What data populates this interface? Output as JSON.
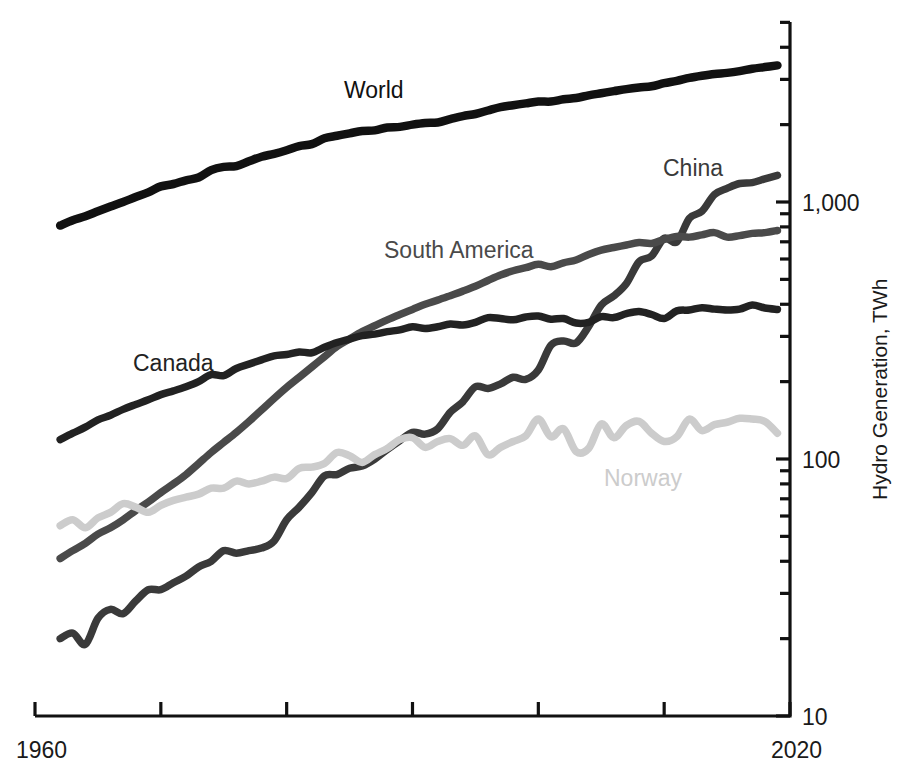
{
  "chart_data": {
    "type": "line",
    "title": "",
    "xlabel": "",
    "ylabel": "Hydro Generation, TWh",
    "yscale": "log",
    "ylim": [
      10,
      3000
    ],
    "xlim": [
      1960,
      2020
    ],
    "grid": false,
    "legend_position": "inline-labels",
    "y_tick_labels": [
      "1,000",
      "100",
      "10"
    ],
    "y_tick_values": [
      1000,
      100,
      10
    ],
    "x_tick_labels": [
      "1960",
      "2020"
    ],
    "x_tick_values": [
      1960,
      1970,
      1980,
      1990,
      2000,
      2010,
      2020
    ],
    "x_visible_tick_labels": [
      {
        "label": "1960",
        "value": 1960
      },
      {
        "label": "2020",
        "value": 2020
      }
    ],
    "series": [
      {
        "name": "World",
        "label": "World",
        "color": "#111111",
        "label_x": 344,
        "label_y": 98,
        "x": [
          1962,
          1963,
          1964,
          1965,
          1966,
          1967,
          1968,
          1969,
          1970,
          1971,
          1972,
          1973,
          1974,
          1975,
          1976,
          1977,
          1978,
          1979,
          1980,
          1981,
          1982,
          1983,
          1984,
          1985,
          1986,
          1987,
          1988,
          1989,
          1990,
          1991,
          1992,
          1993,
          1994,
          1995,
          1996,
          1997,
          1998,
          1999,
          2000,
          2001,
          2002,
          2003,
          2004,
          2005,
          2006,
          2007,
          2008,
          2009,
          2010,
          2011,
          2012,
          2013,
          2014,
          2015,
          2016,
          2017,
          2018,
          2019
        ],
        "values": [
          810,
          850,
          880,
          920,
          960,
          1000,
          1045,
          1090,
          1150,
          1175,
          1215,
          1245,
          1330,
          1370,
          1380,
          1440,
          1500,
          1540,
          1590,
          1650,
          1680,
          1770,
          1810,
          1850,
          1890,
          1900,
          1950,
          1960,
          2000,
          2030,
          2040,
          2100,
          2160,
          2200,
          2270,
          2340,
          2380,
          2420,
          2460,
          2460,
          2510,
          2540,
          2600,
          2650,
          2700,
          2750,
          2790,
          2820,
          2900,
          2960,
          3040,
          3100,
          3150,
          3180,
          3230,
          3300,
          3350,
          3400
        ]
      },
      {
        "name": "China",
        "label": "China",
        "color": "#3a3a3a",
        "label_x": 663,
        "label_y": 176,
        "x": [
          1962,
          1963,
          1964,
          1965,
          1966,
          1967,
          1968,
          1969,
          1970,
          1971,
          1972,
          1973,
          1974,
          1975,
          1976,
          1977,
          1978,
          1979,
          1980,
          1981,
          1982,
          1983,
          1984,
          1985,
          1986,
          1987,
          1988,
          1989,
          1990,
          1991,
          1992,
          1993,
          1994,
          1995,
          1996,
          1997,
          1998,
          1999,
          2000,
          2001,
          2002,
          2003,
          2004,
          2005,
          2006,
          2007,
          2008,
          2009,
          2010,
          2011,
          2012,
          2013,
          2014,
          2015,
          2016,
          2017,
          2018,
          2019
        ],
        "values": [
          20,
          21,
          19,
          24,
          26,
          25,
          28,
          31,
          31,
          33,
          35,
          38,
          40,
          44,
          43,
          44,
          45,
          48,
          58,
          65,
          74,
          86,
          87,
          92,
          94,
          100,
          109,
          118,
          127,
          125,
          131,
          152,
          167,
          191,
          188,
          196,
          208,
          204,
          222,
          277,
          288,
          283,
          328,
          397,
          431,
          482,
          585,
          616,
          722,
          699,
          864,
          920,
          1070,
          1130,
          1180,
          1190,
          1230,
          1270
        ]
      },
      {
        "name": "South America",
        "label": "South America",
        "color": "#4a4a4a",
        "label_x": 384,
        "label_y": 258,
        "x": [
          1962,
          1963,
          1964,
          1965,
          1966,
          1967,
          1968,
          1969,
          1970,
          1971,
          1972,
          1973,
          1974,
          1975,
          1976,
          1977,
          1978,
          1979,
          1980,
          1981,
          1982,
          1983,
          1984,
          1985,
          1986,
          1987,
          1988,
          1989,
          1990,
          1991,
          1992,
          1993,
          1994,
          1995,
          1996,
          1997,
          1998,
          1999,
          2000,
          2001,
          2002,
          2003,
          2004,
          2005,
          2006,
          2007,
          2008,
          2009,
          2010,
          2011,
          2012,
          2013,
          2014,
          2015,
          2016,
          2017,
          2018,
          2019
        ],
        "values": [
          41,
          44,
          47,
          51,
          54,
          58,
          63,
          68,
          74,
          80,
          87,
          96,
          106,
          116,
          127,
          140,
          155,
          172,
          190,
          208,
          228,
          250,
          274,
          293,
          313,
          330,
          348,
          365,
          382,
          400,
          415,
          432,
          450,
          470,
          495,
          520,
          540,
          555,
          572,
          560,
          580,
          595,
          625,
          650,
          665,
          680,
          695,
          690,
          715,
          735,
          730,
          745,
          760,
          730,
          740,
          755,
          760,
          775
        ]
      },
      {
        "name": "Canada",
        "label": "Canada",
        "color": "#222222",
        "label_x": 133,
        "label_y": 371,
        "x": [
          1962,
          1963,
          1964,
          1965,
          1966,
          1967,
          1968,
          1969,
          1970,
          1971,
          1972,
          1973,
          1974,
          1975,
          1976,
          1977,
          1978,
          1979,
          1980,
          1981,
          1982,
          1983,
          1984,
          1985,
          1986,
          1987,
          1988,
          1989,
          1990,
          1991,
          1992,
          1993,
          1994,
          1995,
          1996,
          1997,
          1998,
          1999,
          2000,
          2001,
          2002,
          2003,
          2004,
          2005,
          2006,
          2007,
          2008,
          2009,
          2010,
          2011,
          2012,
          2013,
          2014,
          2015,
          2016,
          2017,
          2018,
          2019
        ],
        "values": [
          119,
          126,
          133,
          142,
          148,
          156,
          163,
          170,
          178,
          184,
          191,
          200,
          213,
          211,
          225,
          234,
          243,
          252,
          255,
          261,
          259,
          272,
          284,
          293,
          302,
          306,
          313,
          318,
          327,
          322,
          327,
          335,
          332,
          340,
          355,
          352,
          348,
          357,
          360,
          350,
          352,
          338,
          340,
          358,
          355,
          368,
          375,
          365,
          352,
          377,
          380,
          388,
          383,
          380,
          383,
          397,
          387,
          382
        ]
      },
      {
        "name": "Norway",
        "label": "Norway",
        "color": "#cccccc",
        "label_x": 604,
        "label_y": 486,
        "x": [
          1962,
          1963,
          1964,
          1965,
          1966,
          1967,
          1968,
          1969,
          1970,
          1971,
          1972,
          1973,
          1974,
          1975,
          1976,
          1977,
          1978,
          1979,
          1980,
          1981,
          1982,
          1983,
          1984,
          1985,
          1986,
          1987,
          1988,
          1989,
          1990,
          1991,
          1992,
          1993,
          1994,
          1995,
          1996,
          1997,
          1998,
          1999,
          2000,
          2001,
          2002,
          2003,
          2004,
          2005,
          2006,
          2007,
          2008,
          2009,
          2010,
          2011,
          2012,
          2013,
          2014,
          2015,
          2016,
          2017,
          2018,
          2019
        ],
        "values": [
          55,
          58,
          54,
          59,
          62,
          67,
          65,
          62,
          66,
          69,
          71,
          73,
          77,
          77,
          82,
          80,
          82,
          85,
          84,
          92,
          93,
          96,
          106,
          103,
          97,
          104,
          110,
          119,
          121,
          111,
          117,
          120,
          113,
          123,
          104,
          111,
          117,
          123,
          143,
          122,
          131,
          107,
          110,
          137,
          121,
          135,
          140,
          126,
          117,
          122,
          143,
          129,
          136,
          139,
          144,
          143,
          140,
          126
        ]
      }
    ]
  },
  "axes": {
    "y_axis_title": "Hydro Generation, TWh",
    "x_start_label": "1960",
    "x_end_label": "2020"
  }
}
